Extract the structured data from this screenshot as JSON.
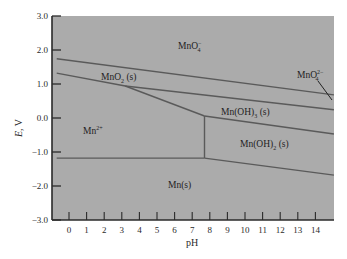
{
  "chart_data": {
    "type": "line",
    "title": "",
    "xlabel": "pH",
    "ylabel": "E, V",
    "xlim": [
      -1,
      15
    ],
    "ylim": [
      -3.0,
      3.0
    ],
    "x_ticks": [
      0,
      1,
      2,
      3,
      4,
      5,
      6,
      7,
      8,
      9,
      10,
      11,
      12,
      13,
      14
    ],
    "y_ticks": [
      3.0,
      2.0,
      1.0,
      0.0,
      -1.0,
      -2.0,
      -3.0
    ],
    "y_tick_labels": [
      "3.0",
      "2.0",
      "1.0",
      "0.0",
      "−1.0",
      "−2.0",
      "−3.0"
    ],
    "grid": false,
    "background_color": "#ababab",
    "line_color": "#5a5a5a",
    "series": [
      {
        "name": "MnO4- / MnO2(s) and MnO4- / MnO4^2- boundary",
        "x": [
          -0.7,
          15.05
        ],
        "y": [
          1.74,
          0.68
        ]
      },
      {
        "name": "MnO2(s) / Mn2+ boundary",
        "x": [
          -0.7,
          3.2,
          7.7
        ],
        "y": [
          1.32,
          0.94,
          0.06
        ]
      },
      {
        "name": "MnO2(s) / Mn(OH)3(s) boundary",
        "x": [
          3.2,
          15.05
        ],
        "y": [
          0.94,
          0.24
        ]
      },
      {
        "name": "Mn(OH)3(s) / Mn(OH)2(s) boundary",
        "x": [
          7.7,
          15.05
        ],
        "y": [
          0.06,
          -0.47
        ]
      },
      {
        "name": "Mn2+ / Mn(OH)2(s) boundary",
        "x": [
          7.7,
          7.7
        ],
        "y": [
          0.06,
          -1.18
        ]
      },
      {
        "name": "Mn2+ / Mn(s) boundary",
        "x": [
          -0.7,
          7.7
        ],
        "y": [
          -1.18,
          -1.18
        ]
      },
      {
        "name": "Mn(OH)2(s) / Mn(s) boundary",
        "x": [
          7.7,
          15.05
        ],
        "y": [
          -1.18,
          -1.68
        ]
      }
    ],
    "regions": [
      {
        "label": "MnO4−",
        "x": 6.2,
        "y": 2.2
      },
      {
        "label": "MnO2(s)",
        "x": 3.6,
        "y": 1.15
      },
      {
        "label": "Mn2+",
        "x": 1.3,
        "y": -0.35
      },
      {
        "label": "Mn(OH)3(s)",
        "x": 10.3,
        "y": -0.2
      },
      {
        "label": "Mn(OH)2(s)",
        "x": 11.3,
        "y": -1.05
      },
      {
        "label": "Mn(s)",
        "x": 6.4,
        "y": -2.2
      },
      {
        "label": "MnO4 2−",
        "x": 14.3,
        "y": 1.2
      }
    ],
    "annotations": [
      {
        "text": "MnO4 2−",
        "arrow_from": [
          14.1,
          1.05
        ],
        "arrow_to": [
          15.0,
          0.68
        ]
      }
    ]
  },
  "axes": {
    "x_title": "pH",
    "y_title_main": "E",
    "y_title_unit": ", V"
  },
  "labels": {
    "mno4": {
      "base": "MnO",
      "sub": "4",
      "sup": "−"
    },
    "mno2": {
      "base": "MnO",
      "sub": "2",
      "suffix": " (s)"
    },
    "mn2plus": {
      "base": "Mn",
      "sup": "2+"
    },
    "mnoh3": {
      "base": "Mn(OH)",
      "sub": "3",
      "suffix": " (s)"
    },
    "mnoh2": {
      "base": "Mn(OH)",
      "sub": "2",
      "suffix": " (s)"
    },
    "mn": {
      "base": "Mn(s)"
    },
    "mno4_2": {
      "base": "MnO",
      "sub": "4",
      "sup": "2−"
    }
  }
}
